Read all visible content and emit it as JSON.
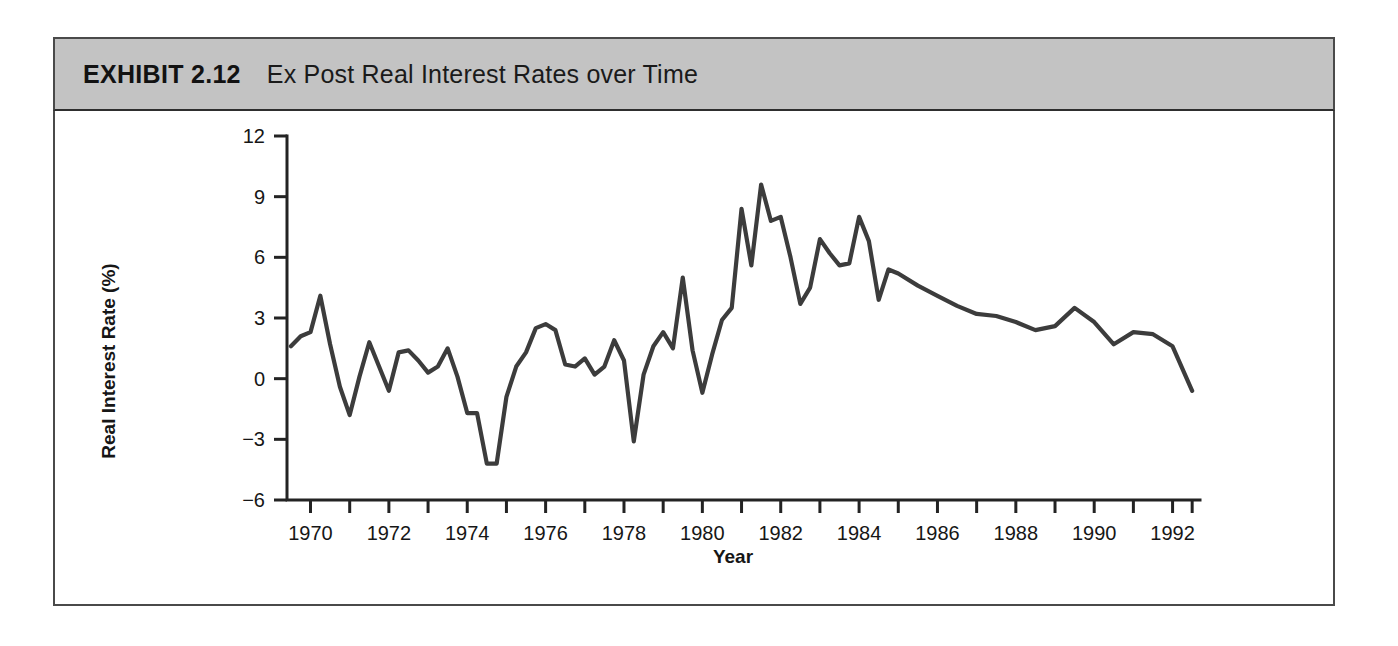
{
  "exhibit": {
    "label": "EXHIBIT 2.12",
    "title": "Ex Post Real Interest Rates over Time",
    "header_bg": "#c3c3c3",
    "frame_color": "#4a4a4a"
  },
  "chart_data": {
    "type": "line",
    "title": "Ex Post Real Interest Rates over Time",
    "xlabel": "Year",
    "ylabel": "Real Interest Rate (%)",
    "xlim": [
      1969.4,
      1992.7
    ],
    "ylim": [
      -6,
      12
    ],
    "grid": false,
    "legend": null,
    "line_color": "#3c3c3c",
    "x_tick_labels": [
      "1970",
      "1972",
      "1974",
      "1976",
      "1978",
      "1980",
      "1982",
      "1984",
      "1986",
      "1988",
      "1990",
      "1992"
    ],
    "x_tick_values": [
      1970,
      1972,
      1974,
      1976,
      1978,
      1980,
      1982,
      1984,
      1986,
      1988,
      1990,
      1992
    ],
    "x_minor_tick_values": [
      1971,
      1973,
      1975,
      1977,
      1979,
      1981,
      1983,
      1985,
      1987,
      1989,
      1991
    ],
    "y_tick_labels": [
      "12",
      "9",
      "6",
      "3",
      "0",
      "-3",
      "-6"
    ],
    "y_tick_values": [
      12,
      9,
      6,
      3,
      0,
      -3,
      -6
    ],
    "series": [
      {
        "name": "Ex post real interest rate",
        "x": [
          1969.5,
          1969.75,
          1970.0,
          1970.25,
          1970.5,
          1970.75,
          1971.0,
          1971.25,
          1971.5,
          1971.75,
          1972.0,
          1972.25,
          1972.5,
          1972.75,
          1973.0,
          1973.25,
          1973.5,
          1973.75,
          1974.0,
          1974.25,
          1974.5,
          1974.75,
          1975.0,
          1975.25,
          1975.5,
          1975.75,
          1976.0,
          1976.25,
          1976.5,
          1976.75,
          1977.0,
          1977.25,
          1977.5,
          1977.75,
          1978.0,
          1978.25,
          1978.5,
          1978.75,
          1979.0,
          1979.25,
          1979.5,
          1979.75,
          1980.0,
          1980.25,
          1980.5,
          1980.75,
          1981.0,
          1981.25,
          1981.5,
          1981.75,
          1982.0,
          1982.25,
          1982.5,
          1982.75,
          1983.0,
          1983.25,
          1983.5,
          1983.75,
          1984.0,
          1984.25,
          1984.5,
          1984.75,
          1985.0,
          1985.5,
          1986.0,
          1986.5,
          1987.0,
          1987.5,
          1988.0,
          1988.5,
          1989.0,
          1989.5,
          1990.0,
          1990.5,
          1991.0,
          1991.5,
          1992.0,
          1992.5
        ],
        "values": [
          1.6,
          2.1,
          2.3,
          4.1,
          1.7,
          -0.4,
          -1.8,
          0.1,
          1.8,
          0.6,
          -0.6,
          1.3,
          1.4,
          0.9,
          0.3,
          0.6,
          1.5,
          0.1,
          -1.7,
          -1.7,
          -4.2,
          -4.2,
          -0.9,
          0.6,
          1.3,
          2.5,
          2.7,
          2.4,
          0.7,
          0.6,
          1.0,
          0.2,
          0.6,
          1.9,
          0.9,
          -3.1,
          0.2,
          1.6,
          2.3,
          1.5,
          5.0,
          1.4,
          -0.7,
          1.2,
          2.9,
          3.5,
          8.4,
          5.6,
          9.6,
          7.8,
          8.0,
          6.0,
          3.7,
          4.5,
          6.9,
          6.2,
          5.6,
          5.7,
          8.0,
          6.8,
          3.9,
          5.4,
          5.2,
          4.6,
          4.1,
          3.6,
          3.2,
          3.1,
          2.8,
          2.4,
          2.6,
          3.5,
          2.8,
          1.7,
          2.3,
          2.2,
          1.6,
          -0.6
        ]
      }
    ]
  }
}
